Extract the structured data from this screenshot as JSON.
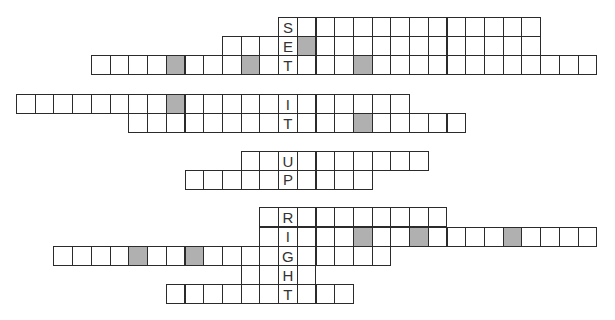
{
  "puzzle": {
    "shade_color": "#b0b0b0",
    "key_column": 14,
    "groups": [
      {
        "word": "SET",
        "rows": [
          {
            "start": 14,
            "end": 27,
            "letter": "S",
            "shaded": []
          },
          {
            "start": 11,
            "end": 27,
            "letter": "E",
            "shaded": [
              15
            ]
          },
          {
            "start": 4,
            "end": 30,
            "letter": "T",
            "shaded": [
              8,
              12,
              18
            ]
          }
        ]
      },
      {
        "word": "IT",
        "rows": [
          {
            "start": 0,
            "end": 20,
            "letter": "I",
            "shaded": [
              8
            ]
          },
          {
            "start": 6,
            "end": 23,
            "letter": "T",
            "shaded": [
              18
            ]
          }
        ]
      },
      {
        "word": "UP",
        "rows": [
          {
            "start": 12,
            "end": 21,
            "letter": "U",
            "shaded": []
          },
          {
            "start": 9,
            "end": 18,
            "letter": "P",
            "shaded": []
          }
        ]
      },
      {
        "word": "RIGHT",
        "rows": [
          {
            "start": 13,
            "end": 22,
            "letter": "R",
            "shaded": []
          },
          {
            "start": 13,
            "end": 30,
            "letter": "I",
            "shaded": [
              18,
              21,
              26
            ]
          },
          {
            "start": 2,
            "end": 19,
            "letter": "G",
            "shaded": [
              6,
              9
            ]
          },
          {
            "start": 12,
            "end": 15,
            "letter": "H",
            "shaded": []
          },
          {
            "start": 8,
            "end": 17,
            "letter": "T",
            "shaded": []
          }
        ]
      }
    ]
  }
}
